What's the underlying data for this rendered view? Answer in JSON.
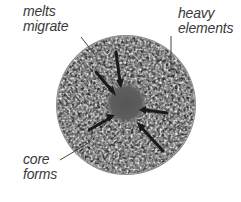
{
  "diagram": {
    "labels": {
      "melts_migrate": [
        "melts",
        "migrate"
      ],
      "heavy_elements": [
        "heavy",
        "elements"
      ],
      "core_forms": [
        "core",
        "forms"
      ]
    },
    "colors": {
      "background": "#ffffff",
      "body_light": "#d8d8d8",
      "body_mid": "#8a8a8a",
      "body_dark": "#3c3c3c",
      "core": "#5a5a5a",
      "arrow": "#1a1a1a",
      "leader_line": "#444444",
      "text": "#3a3a3a"
    },
    "icons": {
      "body": "granular-sphere",
      "core": "dark-core-disc",
      "arrows": "inward-arrows"
    }
  }
}
